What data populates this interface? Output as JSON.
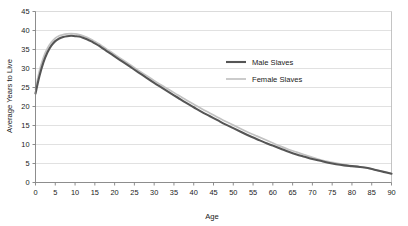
{
  "chart_data": {
    "type": "line",
    "title": "",
    "subtitle": "",
    "xlabel": "Age",
    "ylabel": "Average Years to Live",
    "xlim": [
      0,
      90
    ],
    "ylim": [
      0,
      45
    ],
    "xticks": [
      0,
      5,
      10,
      15,
      20,
      25,
      30,
      35,
      40,
      45,
      50,
      55,
      60,
      65,
      70,
      75,
      80,
      85,
      90
    ],
    "yticks": [
      0,
      5,
      10,
      15,
      20,
      25,
      30,
      35,
      40,
      45
    ],
    "grid": "horizontal",
    "legend_position": "inside-upper-right",
    "x": [
      0,
      1,
      2,
      3,
      4,
      5,
      6,
      7,
      8,
      9,
      10,
      11,
      12,
      13,
      14,
      15,
      16,
      17,
      18,
      19,
      20,
      22,
      24,
      26,
      28,
      30,
      32,
      34,
      36,
      38,
      40,
      42,
      44,
      46,
      48,
      50,
      52,
      54,
      56,
      58,
      60,
      62,
      64,
      66,
      68,
      70,
      72,
      74,
      76,
      78,
      80,
      82,
      84,
      86,
      88,
      90
    ],
    "series": [
      {
        "name": "Male Slaves",
        "color": "#555555",
        "linewidth": 2.1,
        "values": [
          23.4,
          28.0,
          31.6,
          34.2,
          36.0,
          37.2,
          37.9,
          38.3,
          38.5,
          38.6,
          38.5,
          38.4,
          38.1,
          37.7,
          37.2,
          36.6,
          36.0,
          35.3,
          34.6,
          33.9,
          33.2,
          31.8,
          30.4,
          29.0,
          27.6,
          26.2,
          24.9,
          23.6,
          22.3,
          21.0,
          19.8,
          18.6,
          17.5,
          16.4,
          15.3,
          14.3,
          13.3,
          12.3,
          11.4,
          10.5,
          9.7,
          8.9,
          8.1,
          7.4,
          6.8,
          6.2,
          5.7,
          5.2,
          4.8,
          4.5,
          4.3,
          4.1,
          3.8,
          3.3,
          2.8,
          2.3
        ]
      },
      {
        "name": "Female Slaves",
        "color": "#c2c2c2",
        "linewidth": 1.7,
        "values": [
          24.5,
          29.4,
          32.9,
          35.3,
          36.9,
          38.0,
          38.6,
          38.9,
          39.1,
          39.2,
          39.1,
          38.9,
          38.6,
          38.2,
          37.7,
          37.1,
          36.5,
          35.8,
          35.1,
          34.4,
          33.7,
          32.3,
          30.9,
          29.5,
          28.2,
          26.8,
          25.5,
          24.3,
          23.0,
          21.8,
          20.6,
          19.4,
          18.3,
          17.2,
          16.1,
          15.1,
          14.1,
          13.1,
          12.2,
          11.3,
          10.4,
          9.5,
          8.7,
          8.0,
          7.3,
          6.6,
          6.0,
          5.5,
          5.1,
          4.7,
          4.4,
          4.1,
          3.8,
          3.3,
          2.8,
          2.4
        ]
      }
    ],
    "legend": [
      {
        "label": "Male Slaves",
        "color": "#555555"
      },
      {
        "label": "Female Slaves",
        "color": "#c2c2c2"
      }
    ],
    "colors": {
      "male": "#555555",
      "female": "#c2c2c2",
      "grid": "#d9d9d9",
      "axis": "#808080",
      "plot_border": "#b5b5b5",
      "background": "#ffffff",
      "text": "#1a1a1a"
    }
  }
}
